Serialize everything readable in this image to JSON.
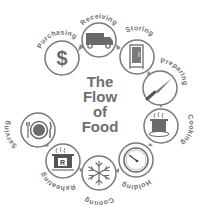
{
  "title": {
    "lines": [
      "The",
      "Flow",
      "of",
      "Food"
    ]
  },
  "colors": {
    "stroke": "#7a7a7a",
    "fill": "#6a6a6a",
    "text": "#6f6f6f",
    "background": "#ffffff"
  },
  "steps": [
    {
      "label": "Purchasing",
      "icon": "dollar-sign-icon"
    },
    {
      "label": "Receiving",
      "icon": "truck-icon"
    },
    {
      "label": "Storing",
      "icon": "refrigerator-icon"
    },
    {
      "label": "Preparing",
      "icon": "knife-icon"
    },
    {
      "label": "Cooking",
      "icon": "steaming-pot-icon"
    },
    {
      "label": "Holding",
      "icon": "thermometer-dial-icon"
    },
    {
      "label": "Cooling",
      "icon": "snowflake-icon"
    },
    {
      "label": "Reheating",
      "icon": "reheating-pot-icon"
    },
    {
      "label": "Serving",
      "icon": "plate-utensils-icon"
    }
  ],
  "reheating_icon_letter": "R",
  "purchasing_icon_symbol": "$"
}
